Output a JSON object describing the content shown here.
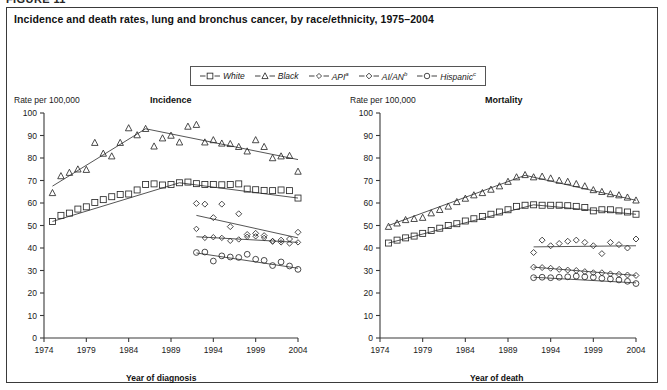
{
  "figure": {
    "number_label": "FIGURE 11",
    "title": "Incidence and death rates, lung and bronchus cancer, by race/ethnicity, 1975–2004"
  },
  "legend": {
    "items": [
      {
        "label": "White",
        "marker": "square-marker",
        "note": ""
      },
      {
        "label": "Black",
        "marker": "triangle-marker",
        "note": ""
      },
      {
        "label": "API",
        "marker": "diamond-filled-marker",
        "note": "a"
      },
      {
        "label": "AI/AN",
        "marker": "diamond-small-marker",
        "note": "b"
      },
      {
        "label": "Hispanic",
        "marker": "circle-marker",
        "note": "c"
      }
    ]
  },
  "panels": {
    "incidence": {
      "panel_title": "Incidence",
      "y_axis_label": "Rate per 100,000",
      "x_axis_label": "Year of diagnosis"
    },
    "mortality": {
      "panel_title": "Mortality",
      "y_axis_label": "Rate per 100,000",
      "x_axis_label": "Year of death"
    }
  },
  "chart_data": [
    {
      "type": "scatter",
      "title": "Incidence",
      "xlabel": "Year of diagnosis",
      "ylabel": "Rate per 100,000",
      "xlim": [
        1974,
        2004
      ],
      "ylim": [
        0,
        100
      ],
      "ytick_labels": [
        "0",
        "10",
        "20",
        "30",
        "40",
        "50",
        "60",
        "70",
        "80",
        "90",
        "100"
      ],
      "xtick_labels": [
        "1974",
        "1979",
        "1984",
        "1989",
        "1994",
        "1999",
        "2004"
      ],
      "grid": false,
      "legend_position": "top-center",
      "series": [
        {
          "name": "White",
          "marker": "square-marker",
          "x": [
            1975,
            1976,
            1977,
            1978,
            1979,
            1980,
            1981,
            1982,
            1983,
            1984,
            1985,
            1986,
            1987,
            1988,
            1989,
            1990,
            1991,
            1992,
            1993,
            1994,
            1995,
            1996,
            1997,
            1998,
            1999,
            2000,
            2001,
            2002,
            2003,
            2004
          ],
          "y": [
            51.8,
            54.5,
            55.5,
            57.3,
            58.3,
            60.2,
            61.5,
            62.8,
            63.8,
            64.0,
            65.8,
            68.2,
            68.5,
            68.0,
            68.2,
            69.0,
            69.3,
            68.6,
            68.2,
            68.2,
            68.1,
            68.2,
            68.5,
            66.2,
            65.9,
            65.6,
            65.5,
            65.8,
            65.5,
            62.2
          ],
          "trend": [
            [
              1975,
              51.8
            ],
            [
              1990,
              69.0
            ],
            [
              2004,
              62.2
            ]
          ]
        },
        {
          "name": "Black",
          "marker": "triangle-marker",
          "x": [
            1975,
            1976,
            1977,
            1978,
            1979,
            1980,
            1981,
            1982,
            1983,
            1984,
            1985,
            1986,
            1987,
            1988,
            1989,
            1990,
            1991,
            1992,
            1993,
            1994,
            1995,
            1996,
            1997,
            1998,
            1999,
            2000,
            2001,
            2002,
            2003,
            2004
          ],
          "y": [
            64.5,
            72.0,
            73.5,
            75.0,
            74.8,
            86.8,
            82.0,
            80.8,
            86.8,
            93.3,
            90.2,
            93.0,
            85.2,
            88.8,
            90.0,
            87.0,
            94.0,
            94.8,
            87.0,
            88.0,
            86.5,
            86.3,
            85.0,
            83.0,
            88.0,
            85.0,
            80.0,
            80.8,
            81.0,
            74.0
          ],
          "trend": [
            [
              1975,
              67.5
            ],
            [
              1986,
              93.0
            ],
            [
              2004,
              79.3
            ]
          ]
        },
        {
          "name": "API",
          "marker": "diamond-filled-marker",
          "x": [
            1992,
            1993,
            1994,
            1995,
            1996,
            1997,
            1998,
            1999,
            2000,
            2001,
            2002,
            2003,
            2004
          ],
          "y": [
            48.5,
            44.5,
            44.8,
            44.5,
            43.2,
            43.8,
            45.0,
            45.2,
            44.5,
            43.0,
            42.5,
            42.0,
            42.5
          ],
          "trend": [
            [
              1992,
              45.0
            ],
            [
              2004,
              42.5
            ]
          ]
        },
        {
          "name": "AI/AN",
          "marker": "diamond-small-marker",
          "x": [
            1992,
            1993,
            1994,
            1995,
            1996,
            1997,
            1998,
            1999,
            2000,
            2001,
            2002,
            2003,
            2004
          ],
          "y": [
            59.8,
            59.5,
            53.5,
            59.5,
            49.5,
            55.2,
            46.0,
            46.5,
            45.5,
            43.0,
            43.5,
            44.0,
            47.0
          ],
          "trend": [
            [
              1992,
              54.5
            ],
            [
              2004,
              44.5
            ]
          ]
        },
        {
          "name": "Hispanic",
          "marker": "circle-marker",
          "x": [
            1992,
            1993,
            1994,
            1995,
            1996,
            1997,
            1998,
            1999,
            2000,
            2001,
            2002,
            2003,
            2004
          ],
          "y": [
            38.0,
            38.2,
            34.2,
            36.5,
            36.0,
            35.8,
            37.2,
            35.0,
            34.5,
            32.2,
            33.8,
            32.0,
            30.5
          ],
          "trend": [
            [
              1992,
              37.8
            ],
            [
              2004,
              31.0
            ]
          ]
        }
      ]
    },
    {
      "type": "scatter",
      "title": "Mortality",
      "xlabel": "Year of death",
      "ylabel": "Rate per 100,000",
      "xlim": [
        1974,
        2004
      ],
      "ylim": [
        0,
        100
      ],
      "ytick_labels": [
        "0",
        "10",
        "20",
        "30",
        "40",
        "50",
        "60",
        "70",
        "80",
        "90",
        "100"
      ],
      "xtick_labels": [
        "1974",
        "1979",
        "1984",
        "1989",
        "1994",
        "1999",
        "2004"
      ],
      "grid": false,
      "legend_position": "top-center",
      "series": [
        {
          "name": "White",
          "marker": "square-marker",
          "x": [
            1975,
            1976,
            1977,
            1978,
            1979,
            1980,
            1981,
            1982,
            1983,
            1984,
            1985,
            1986,
            1987,
            1988,
            1989,
            1990,
            1991,
            1992,
            1993,
            1994,
            1995,
            1996,
            1997,
            1998,
            1999,
            2000,
            2001,
            2002,
            2003,
            2004
          ],
          "y": [
            42.2,
            43.5,
            44.5,
            45.3,
            46.5,
            47.8,
            48.8,
            50.0,
            50.8,
            52.0,
            53.0,
            54.0,
            55.0,
            56.0,
            57.0,
            58.5,
            59.0,
            59.2,
            59.0,
            59.0,
            59.0,
            58.8,
            58.5,
            58.0,
            56.5,
            57.0,
            57.0,
            56.5,
            56.0,
            55.0
          ],
          "trend": [
            [
              1975,
              42.2
            ],
            [
              1992,
              59.2
            ],
            [
              2004,
              55.0
            ]
          ]
        },
        {
          "name": "Black",
          "marker": "triangle-marker",
          "x": [
            1975,
            1976,
            1977,
            1978,
            1979,
            1980,
            1981,
            1982,
            1983,
            1984,
            1985,
            1986,
            1987,
            1988,
            1989,
            1990,
            1991,
            1992,
            1993,
            1994,
            1995,
            1996,
            1997,
            1998,
            1999,
            2000,
            2001,
            2002,
            2003,
            2004
          ],
          "y": [
            49.5,
            51.0,
            52.5,
            53.0,
            53.5,
            55.5,
            57.0,
            58.5,
            60.5,
            62.0,
            63.5,
            64.5,
            66.0,
            67.5,
            69.5,
            71.5,
            72.5,
            71.5,
            71.8,
            71.0,
            70.0,
            69.5,
            68.5,
            67.5,
            65.8,
            65.0,
            64.0,
            63.5,
            62.5,
            61.2
          ],
          "trend": [
            [
              1975,
              50.0
            ],
            [
              1991,
              72.3
            ],
            [
              2004,
              61.2
            ]
          ]
        },
        {
          "name": "API",
          "marker": "diamond-small-marker",
          "x": [
            1992,
            1993,
            1994,
            1995,
            1996,
            1997,
            1998,
            1999,
            2000,
            2001,
            2002,
            2003,
            2004
          ],
          "y": [
            31.5,
            31.3,
            31.0,
            30.5,
            30.2,
            30.0,
            29.5,
            29.0,
            29.0,
            28.5,
            28.3,
            28.0,
            27.8
          ],
          "trend": [
            [
              1992,
              31.5
            ],
            [
              2004,
              27.8
            ]
          ]
        },
        {
          "name": "AI/AN",
          "marker": "diamond-marker",
          "x": [
            1992,
            1993,
            1994,
            1995,
            1996,
            1997,
            1998,
            1999,
            2000,
            2001,
            2002,
            2003,
            2004
          ],
          "y": [
            38.0,
            43.5,
            41.0,
            42.0,
            43.0,
            43.5,
            42.5,
            41.0,
            37.5,
            42.5,
            41.5,
            40.0,
            44.0
          ],
          "trend": [
            [
              1992,
              40.5
            ],
            [
              2004,
              41.0
            ]
          ]
        },
        {
          "name": "Hispanic",
          "marker": "circle-marker",
          "x": [
            1992,
            1993,
            1994,
            1995,
            1996,
            1997,
            1998,
            1999,
            2000,
            2001,
            2002,
            2003,
            2004
          ],
          "y": [
            26.8,
            27.0,
            26.8,
            27.0,
            27.2,
            27.5,
            27.2,
            27.0,
            26.5,
            26.2,
            25.8,
            25.2,
            24.2
          ],
          "trend": [
            [
              1992,
              27.0
            ],
            [
              2004,
              24.5
            ]
          ]
        }
      ]
    }
  ]
}
